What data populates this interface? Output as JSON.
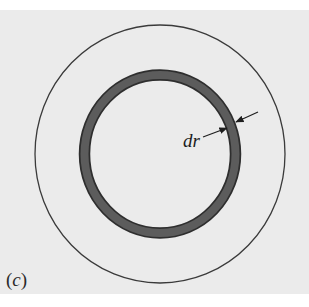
{
  "figure": {
    "panel_label_open": "(",
    "panel_label_letter": "c",
    "panel_label_close": ")",
    "annotation": "dr",
    "colors": {
      "background": "#ebebeb",
      "outer_circle_stroke": "#3a3a3a",
      "ring_fill": "#5c5c5c",
      "ring_edge": "#2e2e2e",
      "arrow": "#1e1e1e"
    },
    "shapes": {
      "outer_circle": {
        "cx": 160,
        "cy": 154,
        "rx": 125,
        "ry": 129
      },
      "shell_ring": {
        "cx": 160,
        "cy": 154,
        "rx": 75.5,
        "ry": 79,
        "thickness": 11
      }
    }
  }
}
